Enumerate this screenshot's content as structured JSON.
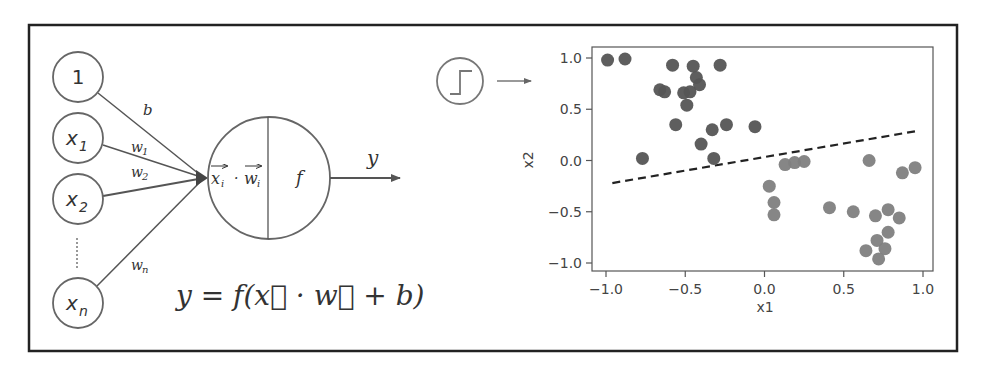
{
  "diagram": {
    "inputs": [
      {
        "label": "1",
        "sub": "",
        "weight": "b",
        "weight_sub": ""
      },
      {
        "label": "x",
        "sub": "1",
        "weight": "w",
        "weight_sub": "1"
      },
      {
        "label": "x",
        "sub": "2",
        "weight": "w",
        "weight_sub": "2"
      },
      {
        "label": "x",
        "sub": "n",
        "weight": "w",
        "weight_sub": "n"
      }
    ],
    "ellipsis": "⋮",
    "neuron": {
      "sum_label_x": "x",
      "sum_label_w": "w",
      "sum_sub": "i",
      "sum_dot": "·",
      "activation_label": "f"
    },
    "output_label": "y",
    "formula": "y = f(x⃗ · w⃗ + b)",
    "activation_icon": "step-function-icon"
  },
  "colors": {
    "stroke": "#555555",
    "frame": "#222222",
    "class_a": "#555555",
    "class_b": "#808080",
    "boundary": "#222222"
  },
  "chart_data": {
    "type": "scatter",
    "title": "",
    "xlabel": "x1",
    "ylabel": "x2",
    "xlim": [
      -1.1,
      1.05
    ],
    "ylim": [
      -1.08,
      1.08
    ],
    "xticks": [
      -1.0,
      -0.5,
      0.0,
      0.5,
      1.0
    ],
    "xtick_labels": [
      "−1.0",
      "−0.5",
      "0.0",
      "0.5",
      "1.0"
    ],
    "yticks": [
      1.0,
      0.5,
      0.0,
      -0.5,
      -1.0
    ],
    "ytick_labels": [
      "1.0",
      "0.5",
      "0.0",
      "−0.5",
      "−1.0"
    ],
    "grid": false,
    "legend": null,
    "series": [
      {
        "name": "class A (dark)",
        "color": "#555555",
        "points": [
          [
            -0.99,
            0.98
          ],
          [
            -0.88,
            0.99
          ],
          [
            -0.58,
            0.93
          ],
          [
            -0.45,
            0.92
          ],
          [
            -0.28,
            0.93
          ],
          [
            -0.43,
            0.81
          ],
          [
            -0.41,
            0.74
          ],
          [
            -0.66,
            0.69
          ],
          [
            -0.63,
            0.67
          ],
          [
            -0.51,
            0.66
          ],
          [
            -0.47,
            0.67
          ],
          [
            -0.49,
            0.54
          ],
          [
            -0.56,
            0.35
          ],
          [
            -0.33,
            0.3
          ],
          [
            -0.24,
            0.35
          ],
          [
            -0.06,
            0.33
          ],
          [
            -0.4,
            0.16
          ],
          [
            -0.77,
            0.02
          ],
          [
            -0.32,
            0.02
          ]
        ]
      },
      {
        "name": "class B (light)",
        "color": "#808080",
        "points": [
          [
            0.13,
            -0.04
          ],
          [
            0.19,
            -0.02
          ],
          [
            0.25,
            -0.01
          ],
          [
            0.66,
            0.0
          ],
          [
            0.87,
            -0.12
          ],
          [
            0.95,
            -0.07
          ],
          [
            0.03,
            -0.25
          ],
          [
            0.06,
            -0.41
          ],
          [
            0.06,
            -0.53
          ],
          [
            0.41,
            -0.46
          ],
          [
            0.56,
            -0.5
          ],
          [
            0.7,
            -0.54
          ],
          [
            0.78,
            -0.48
          ],
          [
            0.85,
            -0.56
          ],
          [
            0.78,
            -0.7
          ],
          [
            0.71,
            -0.78
          ],
          [
            0.76,
            -0.86
          ],
          [
            0.64,
            -0.88
          ],
          [
            0.72,
            -0.96
          ]
        ]
      }
    ],
    "decision_boundary": {
      "style": "dashed",
      "color": "#222222",
      "from": [
        -0.96,
        -0.22
      ],
      "to": [
        0.97,
        0.29
      ]
    }
  }
}
